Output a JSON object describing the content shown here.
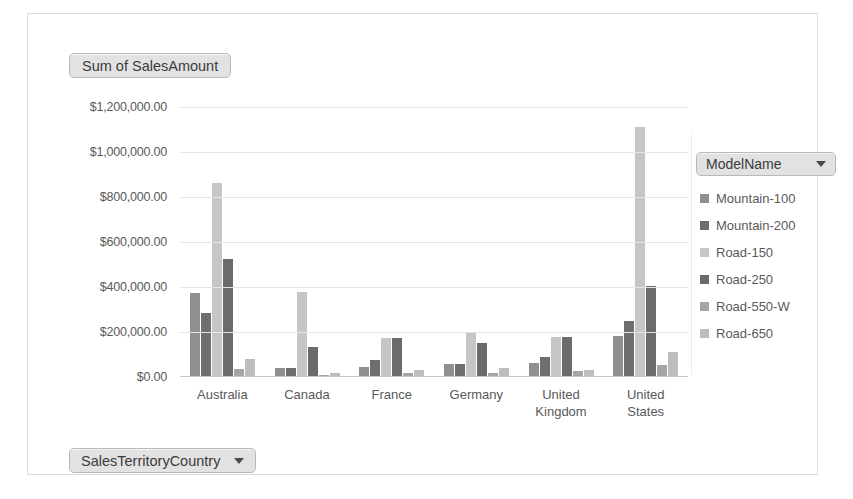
{
  "value_field_button": {
    "label": "Sum of SalesAmount"
  },
  "axis_field_button": {
    "label": "SalesTerritoryCountry",
    "caret_icon": "chevron-down-icon"
  },
  "legend_field_button": {
    "label": "ModelName",
    "caret_icon": "chevron-down-icon"
  },
  "chart_data": {
    "type": "bar",
    "title": "Sum of SalesAmount",
    "xlabel": "SalesTerritoryCountry",
    "ylabel": "Sum of SalesAmount",
    "legend_title": "ModelName",
    "legend_position": "right",
    "grid": true,
    "ylim": [
      0,
      1200000
    ],
    "yticks": [
      1200000,
      1000000,
      800000,
      600000,
      400000,
      200000,
      0
    ],
    "ytick_labels": [
      "$1,200,000.00",
      "$1,000,000.00",
      "$800,000.00",
      "$600,000.00",
      "$400,000.00",
      "$200,000.00",
      "$0.00"
    ],
    "categories": [
      "Australia",
      "Canada",
      "France",
      "Germany",
      "United Kingdom",
      "United States"
    ],
    "category_labels": [
      [
        "Australia"
      ],
      [
        "Canada"
      ],
      [
        "France"
      ],
      [
        "Germany"
      ],
      [
        "United",
        "Kingdom"
      ],
      [
        "United",
        "States"
      ]
    ],
    "series": [
      {
        "name": "Mountain-100",
        "color": "#8f8f8f",
        "values": [
          370000,
          35000,
          40000,
          55000,
          60000,
          180000
        ]
      },
      {
        "name": "Mountain-200",
        "color": "#6e6e6e",
        "values": [
          280000,
          35000,
          70000,
          55000,
          85000,
          245000
        ]
      },
      {
        "name": "Road-150",
        "color": "#c6c6c6",
        "values": [
          860000,
          375000,
          170000,
          195000,
          175000,
          1105000
        ]
      },
      {
        "name": "Road-250",
        "color": "#6b6b6b",
        "values": [
          520000,
          130000,
          170000,
          145000,
          175000,
          400000
        ]
      },
      {
        "name": "Road-550-W",
        "color": "#a5a5a5",
        "values": [
          30000,
          5000,
          12000,
          12000,
          22000,
          50000
        ]
      },
      {
        "name": "Road-650",
        "color": "#bdbdbd",
        "values": [
          75000,
          12000,
          25000,
          35000,
          25000,
          105000
        ]
      }
    ]
  }
}
